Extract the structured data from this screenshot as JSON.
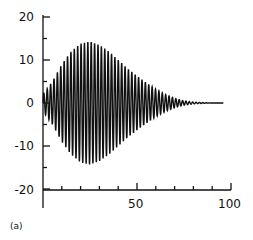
{
  "chart_data": {
    "type": "line",
    "title": "",
    "panel_label": "(a)",
    "xlabel": "",
    "ylabel": "",
    "xlim": [
      0,
      100
    ],
    "ylim": [
      -20,
      20
    ],
    "grid": false,
    "legend": null,
    "x_ticks": [
      0,
      10,
      20,
      30,
      40,
      50,
      60,
      70,
      80,
      90,
      100
    ],
    "x_tick_labels": [
      "50",
      "100"
    ],
    "y_ticks": [
      -20,
      -15,
      -10,
      -5,
      0,
      5,
      10,
      15,
      20
    ],
    "y_tick_labels": [
      "20",
      "10",
      "0",
      "-10",
      "-20"
    ],
    "series": [
      {
        "name": "oscillation",
        "description": "Rapid oscillation about 0 with envelope rising to ~14 near x=25 then decaying to ~0 by x=80",
        "envelope": {
          "x": [
            0,
            5,
            10,
            15,
            20,
            25,
            30,
            35,
            40,
            45,
            50,
            55,
            60,
            65,
            70,
            75,
            80,
            90,
            100
          ],
          "amplitude": [
            2,
            5,
            9,
            12,
            13.8,
            14.3,
            13.5,
            12,
            10,
            8,
            6.3,
            4.7,
            3.2,
            2,
            1.1,
            0.5,
            0.2,
            0,
            0
          ]
        },
        "period": 1.8,
        "x_end": 96
      }
    ]
  },
  "labels": {
    "y20": "20",
    "y10": "10",
    "y0": "0",
    "yn10": "-10",
    "yn20": "-20",
    "x50": "50",
    "x100": "100",
    "panel": "(a)"
  }
}
